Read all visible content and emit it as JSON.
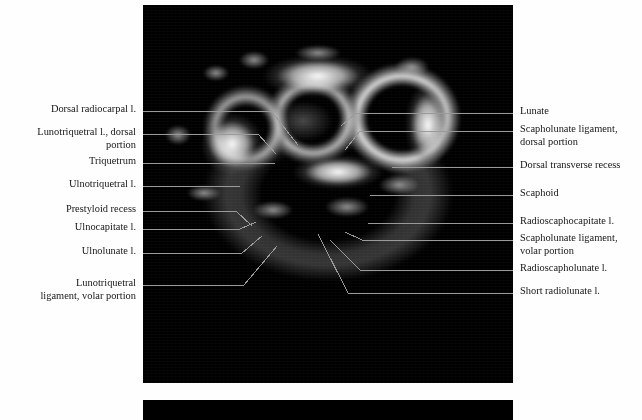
{
  "figure": {
    "type": "axial-mri-wrist",
    "panels": [
      {
        "name": "top-mri-panel",
        "x": 143,
        "y": 5,
        "w": 370,
        "h": 378,
        "background": "#000000"
      },
      {
        "name": "bottom-mri-panel",
        "x": 143,
        "y": 400,
        "w": 370,
        "h": 20,
        "background": "#000000"
      }
    ],
    "page_background": "#fefefe",
    "leader_color": "#9a9a9a",
    "text_color": "#161616"
  },
  "labels_left": [
    {
      "text": "Dorsal radiocarpal l.",
      "y": 111,
      "lines": 1
    },
    {
      "text": "Lunotriquetral l., dorsal\nportion",
      "y": 134,
      "lines": 2
    },
    {
      "text": "Triquetrum",
      "y": 163,
      "lines": 1
    },
    {
      "text": "Ulnotriquetral l.",
      "y": 186,
      "lines": 1
    },
    {
      "text": "Prestyloid recess",
      "y": 211,
      "lines": 1
    },
    {
      "text": "Ulnocapitate l.",
      "y": 229,
      "lines": 1
    },
    {
      "text": "Ulnolunate l.",
      "y": 253,
      "lines": 1
    },
    {
      "text": "Lunotriquetral\nligament, volar portion",
      "y": 285,
      "lines": 2
    }
  ],
  "labels_right": [
    {
      "text": "Lunate",
      "y": 113,
      "lines": 1
    },
    {
      "text": "Scapholunate ligament,\ndorsal portion",
      "y": 131,
      "lines": 2
    },
    {
      "text": "Dorsal transverse recess",
      "y": 167,
      "lines": 1
    },
    {
      "text": "Scaphoid",
      "y": 195,
      "lines": 1
    },
    {
      "text": "Radioscaphocapitate l.",
      "y": 223,
      "lines": 1
    },
    {
      "text": "Scapholunate ligament,\nvolar portion",
      "y": 240,
      "lines": 2
    },
    {
      "text": "Radioscapholunate l.",
      "y": 270,
      "lines": 1
    },
    {
      "text": "Short radiolunate l.",
      "y": 293,
      "lines": 1
    }
  ],
  "anatomy_structures": [
    "Dorsal radiocarpal ligament",
    "Lunotriquetral ligament, dorsal portion",
    "Triquetrum",
    "Ulnotriquetral ligament",
    "Prestyloid recess",
    "Ulnocapitate ligament",
    "Ulnolunate ligament",
    "Lunotriquetral ligament, volar portion",
    "Lunate",
    "Scapholunate ligament, dorsal portion",
    "Dorsal transverse recess",
    "Scaphoid",
    "Radioscaphocapitate ligament",
    "Scapholunate ligament, volar portion",
    "Radioscapholunate ligament",
    "Short radiolunate ligament"
  ]
}
